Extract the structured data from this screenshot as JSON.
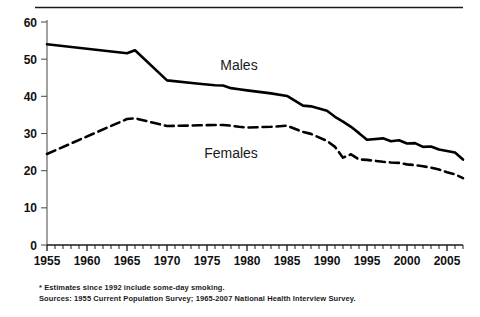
{
  "chart_data": {
    "type": "line",
    "title": "",
    "subtitle": "",
    "xlabel": "",
    "ylabel": "",
    "xlim": [
      1955,
      2007
    ],
    "ylim": [
      0,
      60
    ],
    "yticks": [
      0,
      10,
      20,
      30,
      40,
      50,
      60
    ],
    "xticks": [
      1955,
      1960,
      1965,
      1970,
      1975,
      1980,
      1985,
      1990,
      1995,
      2000,
      2005
    ],
    "x_minor_tick_interval": 1,
    "grid": false,
    "legend_position": "inline-labels",
    "series": [
      {
        "name": "Males",
        "style": "solid",
        "color": "#000000",
        "x": [
          1955,
          1965,
          1966,
          1970,
          1974,
          1976,
          1977,
          1978,
          1979,
          1980,
          1983,
          1985,
          1987,
          1988,
          1990,
          1991,
          1992,
          1993,
          1994,
          1995,
          1997,
          1998,
          1999,
          2000,
          2001,
          2002,
          2003,
          2004,
          2005,
          2006,
          2007
        ],
        "values": [
          54.0,
          51.6,
          52.4,
          44.3,
          43.4,
          43.0,
          42.9,
          42.2,
          41.9,
          41.6,
          40.8,
          40.1,
          37.5,
          37.3,
          36.1,
          34.5,
          33.2,
          31.8,
          30.1,
          28.3,
          28.7,
          27.9,
          28.2,
          27.3,
          27.4,
          26.4,
          26.5,
          25.7,
          25.3,
          24.9,
          23.0
        ]
      },
      {
        "name": "Females",
        "style": "dashed",
        "color": "#000000",
        "x": [
          1955,
          1965,
          1966,
          1970,
          1974,
          1976,
          1977,
          1978,
          1979,
          1980,
          1983,
          1985,
          1987,
          1988,
          1990,
          1991,
          1992,
          1993,
          1994,
          1995,
          1997,
          1998,
          1999,
          2000,
          2001,
          2002,
          2003,
          2004,
          2005,
          2006,
          2007
        ],
        "values": [
          24.5,
          33.9,
          34.1,
          32.0,
          32.2,
          32.3,
          32.3,
          32.1,
          31.8,
          31.6,
          31.8,
          32.1,
          30.4,
          29.9,
          28.0,
          26.4,
          23.5,
          24.4,
          23.0,
          22.9,
          22.4,
          22.2,
          22.1,
          21.7,
          21.5,
          21.2,
          20.8,
          20.3,
          19.6,
          19.0,
          18.0
        ]
      }
    ],
    "annotations": [
      {
        "text": "Males",
        "x": 1979,
        "y": 47
      },
      {
        "text": "Females",
        "x": 1978,
        "y": 23.5
      }
    ]
  },
  "footnote": {
    "line1": "* Estimates since 1992 include some-day smoking.",
    "line2": "Sources: 1955 Current Population Survey; 1965-2007  National Health Interview Survey."
  },
  "axis": {
    "y_tick_labels": [
      "60",
      "50",
      "40",
      "30",
      "20",
      "10",
      "0"
    ],
    "x_tick_labels": [
      "1955",
      "1960",
      "1965",
      "1970",
      "1975",
      "1980",
      "1985",
      "1990",
      "1995",
      "2000",
      "2005"
    ]
  }
}
